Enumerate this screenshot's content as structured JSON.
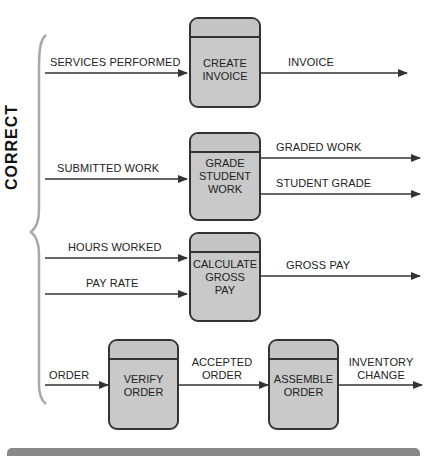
{
  "side_label": "CORRECT",
  "colors": {
    "process_fill": "#c9c9c9",
    "process_border": "#333333",
    "line": "#333333",
    "bracket": "#999999",
    "footer_bar": "#888888"
  },
  "rows": [
    {
      "inputs": [
        {
          "label": "SERVICES PERFORMED"
        }
      ],
      "process": {
        "name": "CREATE\nINVOICE"
      },
      "outputs": [
        {
          "label": "INVOICE"
        }
      ]
    },
    {
      "inputs": [
        {
          "label": "SUBMITTED WORK"
        }
      ],
      "process": {
        "name": "GRADE\nSTUDENT\nWORK"
      },
      "outputs": [
        {
          "label": "GRADED WORK"
        },
        {
          "label": "STUDENT GRADE"
        }
      ]
    },
    {
      "inputs": [
        {
          "label": "HOURS WORKED"
        },
        {
          "label": "PAY RATE"
        }
      ],
      "process": {
        "name": "CALCULATE\nGROSS\nPAY"
      },
      "outputs": [
        {
          "label": "GROSS PAY"
        }
      ]
    },
    {
      "inputs": [
        {
          "label": "ORDER"
        }
      ],
      "process": {
        "name": "VERIFY\nORDER"
      },
      "middle_flow": {
        "label": "ACCEPTED\nORDER"
      },
      "process2": {
        "name": "ASSEMBLE\nORDER"
      },
      "outputs": [
        {
          "label": "INVENTORY\nCHANGE"
        }
      ]
    }
  ]
}
